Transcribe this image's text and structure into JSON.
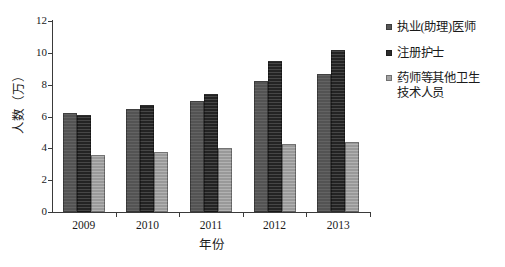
{
  "chart_data": {
    "type": "bar",
    "title": "",
    "xlabel": "年份",
    "ylabel": "人数（万）",
    "categories": [
      "2009",
      "2010",
      "2011",
      "2012",
      "2013"
    ],
    "series": [
      {
        "name": "执业(助理)医师",
        "values": [
          6.2,
          6.5,
          7.0,
          8.2,
          8.7
        ],
        "color": "#575757"
      },
      {
        "name": "注册护士",
        "values": [
          6.1,
          6.7,
          7.4,
          9.5,
          10.2
        ],
        "color": "#2b2b2b"
      },
      {
        "name": "药师等其他卫生\n技术人员",
        "values": [
          3.6,
          3.8,
          4.0,
          4.3,
          4.4
        ],
        "color": "#a3a3a3"
      }
    ],
    "ylim": [
      0,
      12
    ],
    "yticks": [
      "0",
      "2",
      "4",
      "6",
      "8",
      "10",
      "12"
    ],
    "ytick_values": [
      0,
      2,
      4,
      6,
      8,
      10,
      12
    ],
    "grid": false,
    "legend_position": "right"
  }
}
